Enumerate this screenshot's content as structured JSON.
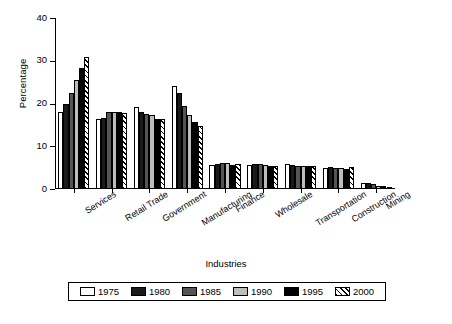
{
  "chart_data": {
    "type": "bar",
    "title": "",
    "xlabel": "Industries",
    "ylabel": "Percentage",
    "ylim": [
      0,
      40
    ],
    "yticks": [
      0,
      10,
      20,
      30,
      40
    ],
    "grid": false,
    "legend_position": "bottom",
    "categories": [
      "Services",
      "Retail Trade",
      "Government",
      "Manufacturing",
      "Finance",
      "Wholesale",
      "Transportation",
      "Construction",
      "Mining"
    ],
    "series": [
      {
        "name": "1975",
        "color": "#ffffff",
        "pattern": "solid",
        "values": [
          18.1,
          16.4,
          19.2,
          24.0,
          5.6,
          5.7,
          5.9,
          5.0,
          1.4
        ]
      },
      {
        "name": "1980",
        "color": "#1a1a1a",
        "pattern": "solid",
        "values": [
          19.8,
          16.7,
          18.0,
          22.5,
          5.9,
          5.9,
          5.7,
          5.1,
          1.5
        ]
      },
      {
        "name": "1985",
        "color": "#555555",
        "pattern": "solid",
        "values": [
          22.5,
          17.9,
          17.6,
          19.5,
          6.0,
          5.8,
          5.5,
          4.8,
          1.1
        ]
      },
      {
        "name": "1990",
        "color": "#bdbdbd",
        "pattern": "solid",
        "values": [
          25.6,
          18.1,
          17.3,
          17.4,
          6.1,
          5.7,
          5.5,
          5.0,
          0.8
        ]
      },
      {
        "name": "1995",
        "color": "#000000",
        "pattern": "solid",
        "values": [
          28.3,
          18.1,
          16.4,
          15.6,
          5.7,
          5.5,
          5.4,
          4.6,
          0.6
        ]
      },
      {
        "name": "2000",
        "color": "#ffffff",
        "pattern": "diagonal-hatch",
        "values": [
          30.8,
          17.7,
          16.3,
          14.7,
          5.8,
          5.5,
          5.4,
          5.2,
          0.5
        ]
      }
    ]
  }
}
